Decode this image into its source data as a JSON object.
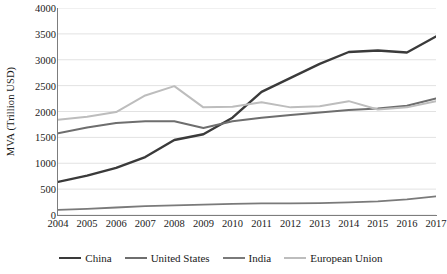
{
  "chart_data": {
    "type": "line",
    "title": "",
    "xlabel": "",
    "ylabel": "MVA (Trillion USD)",
    "categories": [
      "2004",
      "2005",
      "2006",
      "2007",
      "2008",
      "2009",
      "2010",
      "2011",
      "2012",
      "2013",
      "2014",
      "2015",
      "2016",
      "2017"
    ],
    "x": [
      2004,
      2005,
      2006,
      2007,
      2008,
      2009,
      2010,
      2011,
      2012,
      2013,
      2014,
      2015,
      2016,
      2017
    ],
    "xlim": [
      2004,
      2017
    ],
    "ylim": [
      0,
      4000
    ],
    "yticks": [
      0,
      500,
      1000,
      1500,
      2000,
      2500,
      3000,
      3500,
      4000
    ],
    "ytick_labels": [
      "0",
      "500",
      "1000",
      "1500",
      "2000",
      "2500",
      "3000",
      "3500",
      "4000"
    ],
    "grid": "horizontal",
    "legend_position": "bottom",
    "series": [
      {
        "name": "China",
        "color": "#3a3a3a",
        "width": 2.4,
        "values": [
          640,
          760,
          910,
          1120,
          1450,
          1560,
          1880,
          2380,
          2650,
          2920,
          3150,
          3180,
          3140,
          3450
        ]
      },
      {
        "name": "United States",
        "color": "#6e6e6e",
        "width": 2.0,
        "values": [
          1580,
          1690,
          1780,
          1810,
          1810,
          1680,
          1810,
          1880,
          1930,
          1980,
          2030,
          2060,
          2110,
          2250
        ]
      },
      {
        "name": "India",
        "color": "#7a7a7a",
        "width": 1.8,
        "values": [
          100,
          120,
          145,
          170,
          185,
          200,
          215,
          225,
          225,
          230,
          245,
          265,
          300,
          360
        ]
      },
      {
        "name": "European Union",
        "color": "#bdbdbd",
        "width": 2.0,
        "values": [
          1840,
          1900,
          1990,
          2310,
          2490,
          2080,
          2090,
          2180,
          2080,
          2100,
          2200,
          2040,
          2080,
          2200
        ]
      }
    ]
  },
  "legend": {
    "items": [
      {
        "label": "China"
      },
      {
        "label": "United States"
      },
      {
        "label": "India"
      },
      {
        "label": "European Union"
      }
    ]
  }
}
